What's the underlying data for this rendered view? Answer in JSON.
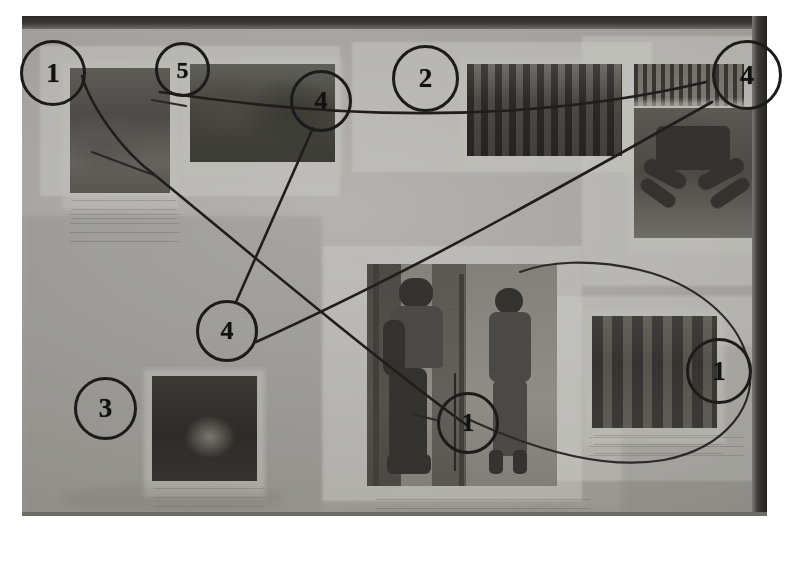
{
  "document": {
    "kind": "photograph-of-poster-with-handdrawn-annotations",
    "background_color": "#ffffff",
    "photo_background_color": "#9a9a98",
    "frame_color": "#2b2a28",
    "annotation_color": "#1b1b1a"
  },
  "annotations": {
    "circles": [
      {
        "id": "c1",
        "label": "1",
        "x": 20,
        "y": 40,
        "size": 66
      },
      {
        "id": "c2",
        "label": "5",
        "x": 155,
        "y": 42,
        "size": 55
      },
      {
        "id": "c3",
        "label": "4",
        "x": 290,
        "y": 70,
        "size": 62
      },
      {
        "id": "c4",
        "label": "2",
        "x": 392,
        "y": 45,
        "size": 67
      },
      {
        "id": "c5",
        "label": "4",
        "x": 712,
        "y": 40,
        "size": 70
      },
      {
        "id": "c6",
        "label": "4",
        "x": 196,
        "y": 300,
        "size": 62
      },
      {
        "id": "c7",
        "label": "3",
        "x": 74,
        "y": 377,
        "size": 63
      },
      {
        "id": "c8",
        "label": "1",
        "x": 437,
        "y": 392,
        "size": 62
      },
      {
        "id": "c9",
        "label": "1",
        "x": 686,
        "y": 338,
        "size": 66
      }
    ],
    "lines": [
      {
        "id": "l1",
        "from": "c2",
        "to": "c5",
        "style": "straight"
      },
      {
        "id": "l2",
        "from": "c3",
        "to": "c6",
        "style": "straight"
      },
      {
        "id": "l3",
        "from": "c6",
        "to": "c5",
        "style": "straight"
      },
      {
        "id": "l4",
        "from": "c1",
        "to": "c8",
        "style": "straight"
      },
      {
        "id": "l5",
        "from": "c8",
        "to": "c9",
        "style": "curved-loop"
      }
    ]
  },
  "board": {
    "photos": [
      {
        "id": "p1",
        "name": "rock-landscape-photo",
        "x": 48,
        "y": 52,
        "w": 100,
        "h": 125
      },
      {
        "id": "p2",
        "name": "green-field-photo",
        "x": 168,
        "y": 48,
        "w": 145,
        "h": 98
      },
      {
        "id": "p3",
        "name": "group-of-people-photo",
        "x": 445,
        "y": 48,
        "w": 155,
        "h": 92
      },
      {
        "id": "p4",
        "name": "joined-hands-photo",
        "x": 612,
        "y": 92,
        "w": 120,
        "h": 130
      },
      {
        "id": "p5",
        "name": "hatched-strip-photo",
        "x": 612,
        "y": 48,
        "w": 110,
        "h": 42
      },
      {
        "id": "p6",
        "name": "night-scene-photo",
        "x": 130,
        "y": 360,
        "w": 105,
        "h": 105
      },
      {
        "id": "p7",
        "name": "doorway-figures-photo",
        "x": 345,
        "y": 248,
        "w": 190,
        "h": 222
      },
      {
        "id": "p8",
        "name": "framed-people-photo",
        "x": 570,
        "y": 300,
        "w": 125,
        "h": 112
      }
    ],
    "caption_blocks": [
      {
        "id": "n1",
        "x": 46,
        "y": 190,
        "w": 105,
        "h": 36
      },
      {
        "id": "n2",
        "x": 130,
        "y": 470,
        "w": 130,
        "h": 32
      },
      {
        "id": "n3",
        "x": 352,
        "y": 478,
        "w": 210,
        "h": 30
      },
      {
        "id": "n4",
        "x": 565,
        "y": 418,
        "w": 150,
        "h": 26
      }
    ]
  }
}
